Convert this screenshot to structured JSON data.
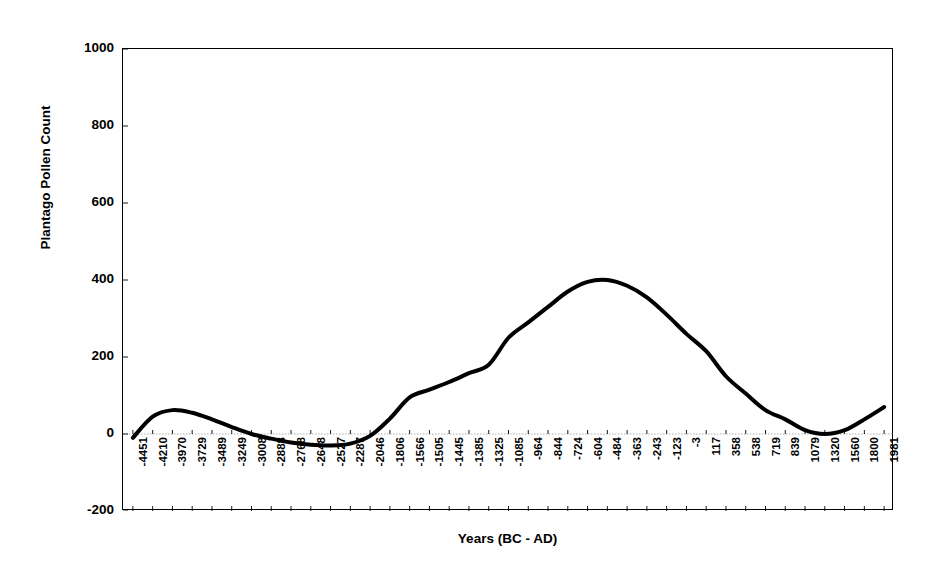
{
  "chart_data": {
    "type": "line",
    "title": "",
    "xlabel": "Years (BC - AD)",
    "ylabel": "Plantago Pollen Count",
    "ylim": [
      -200,
      1000
    ],
    "y_ticks": [
      1000,
      800,
      600,
      400,
      200,
      0,
      -200
    ],
    "grid": false,
    "legend": "none",
    "x_tick_labels": [
      "-4451",
      "-4210",
      "-3970",
      "-3729",
      "-3489",
      "-3249",
      "-3008",
      "-2888",
      "-2768",
      "-2648",
      "-2527",
      "-2287",
      "-2046",
      "-1806",
      "-1566",
      "-1505",
      "-1445",
      "-1385",
      "-1325",
      "-1085",
      "-964",
      "-844",
      "-724",
      "-604",
      "-484",
      "-363",
      "-243",
      "-123",
      "-3",
      "117",
      "358",
      "538",
      "719",
      "839",
      "1079",
      "1320",
      "1560",
      "1800",
      "1981"
    ],
    "series": [
      {
        "name": "Plantago Pollen Count",
        "x": [
          "-4451",
          "-4210",
          "-3970",
          "-3729",
          "-3489",
          "-3249",
          "-3008",
          "-2888",
          "-2768",
          "-2648",
          "-2527",
          "-2287",
          "-2046",
          "-1806",
          "-1566",
          "-1505",
          "-1445",
          "-1385",
          "-1325",
          "-1085",
          "-964",
          "-844",
          "-724",
          "-604",
          "-484",
          "-363",
          "-243",
          "-123",
          "-3",
          "117",
          "358",
          "538",
          "719",
          "839",
          "1079",
          "1320",
          "1560",
          "1800",
          "1981"
        ],
        "values": [
          -10,
          45,
          62,
          55,
          38,
          18,
          0,
          -12,
          -22,
          -28,
          -30,
          -25,
          -5,
          40,
          95,
          115,
          135,
          158,
          180,
          250,
          290,
          330,
          370,
          395,
          400,
          385,
          355,
          310,
          260,
          215,
          150,
          105,
          62,
          38,
          10,
          0,
          10,
          38,
          70
        ],
        "color": "#000000",
        "line_width": 4,
        "smooth": true
      }
    ]
  }
}
